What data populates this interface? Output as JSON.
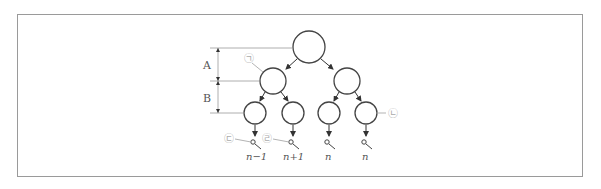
{
  "diagram": {
    "type": "meiosis-tree",
    "dimension_labels": {
      "a": "A",
      "b": "B"
    },
    "markers": {
      "m1": "㉠",
      "m2": "㉡",
      "m3": "㉢",
      "m4": "㉣"
    },
    "gamete_labels": [
      "n−1",
      "n+1",
      "n",
      "n"
    ],
    "colors": {
      "stroke": "#444444",
      "frame": "#9a9a9a",
      "marker": "#aaaaaa"
    }
  }
}
